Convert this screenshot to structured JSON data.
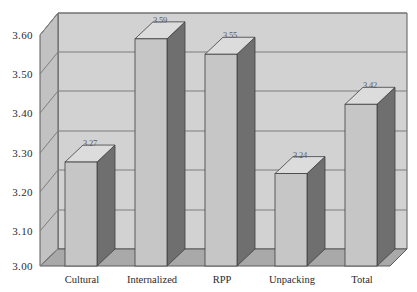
{
  "chart_data": {
    "type": "bar",
    "title": "",
    "subtitle": "",
    "xlabel": "",
    "ylabel": "",
    "categories": [
      "Cultural",
      "Internalized",
      "RPP",
      "Unpacking",
      "Total"
    ],
    "values": [
      3.27,
      3.59,
      3.55,
      3.24,
      3.42
    ],
    "value_labels": [
      "3.27",
      "3.59",
      "3.55",
      "3.24",
      "3.42"
    ],
    "ylim": [
      3.0,
      3.6
    ],
    "ytick_labels": [
      "3.00",
      "3.10",
      "3.20",
      "3.30",
      "3.40",
      "3.50",
      "3.60"
    ],
    "ytick_values": [
      3.0,
      3.1,
      3.2,
      3.3,
      3.4,
      3.5,
      3.6
    ],
    "grid": true,
    "grid_axis": "y",
    "legend": false,
    "legend_position": "none",
    "style": "3d-column",
    "series": [
      {
        "name": "Mean score",
        "values": [
          3.27,
          3.59,
          3.55,
          3.24,
          3.42
        ]
      }
    ]
  },
  "colors": {
    "bar_front": "#c6c6c6",
    "bar_side": "#6f6f6f",
    "bar_top": "#dcdcdc",
    "bar_outline": "#3f3f3f",
    "wall_back": "#d2d2d2",
    "wall_left": "#c2c2c2",
    "floor": "#a9a9a9",
    "gridline": "#7d7d7d",
    "frame": "#5a5a5a",
    "text": "#2b2b2b",
    "label_text": "#5d5d5d",
    "background": "#ffffff"
  },
  "axis": {
    "y_tick_0": "3.00",
    "y_tick_1": "3.10",
    "y_tick_2": "3.20",
    "y_tick_3": "3.30",
    "y_tick_4": "3.40",
    "y_tick_5": "3.50",
    "y_tick_6": "3.60"
  },
  "bars": [
    {
      "category": "Cultural",
      "value": 3.27,
      "label": "3.27"
    },
    {
      "category": "Internalized",
      "value": 3.59,
      "label": "3.59"
    },
    {
      "category": "RPP",
      "value": 3.55,
      "label": "3.55"
    },
    {
      "category": "Unpacking",
      "value": 3.24,
      "label": "3.24"
    },
    {
      "category": "Total",
      "value": 3.42,
      "label": "3.42"
    }
  ]
}
